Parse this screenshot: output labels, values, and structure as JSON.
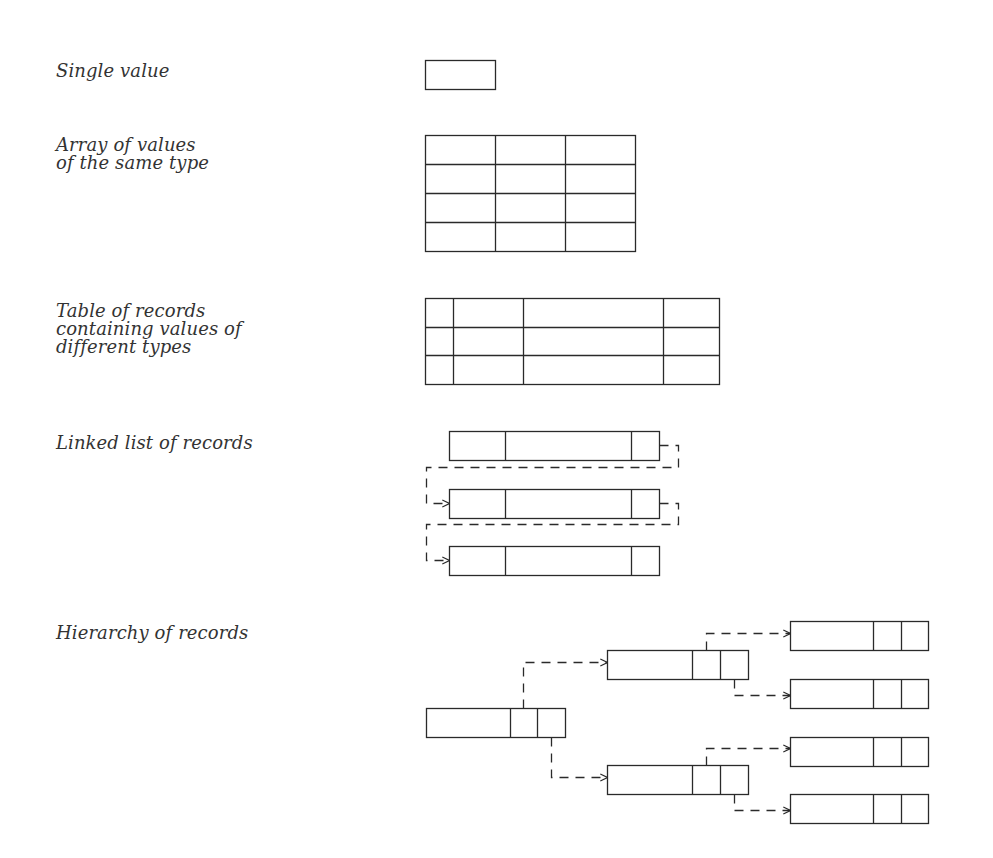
{
  "diagram": {
    "line_color": "#2a2a2a",
    "text_color": "#333333",
    "rows": [
      {
        "id": "single",
        "label": "Single value"
      },
      {
        "id": "array",
        "label": "Array of values\nof the same type"
      },
      {
        "id": "table",
        "label": "Table of records\ncontaining values of\ndifferent types"
      },
      {
        "id": "linked",
        "label": "Linked list of records"
      },
      {
        "id": "hierarchy",
        "label": "Hierarchy of records"
      }
    ]
  }
}
